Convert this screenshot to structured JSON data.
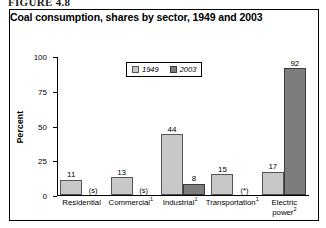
{
  "figure": {
    "caption": "FIGURE 4.8"
  },
  "chart_data": {
    "type": "bar",
    "title": "Coal consumption, shares by sector, 1949 and 2003",
    "xlabel": "",
    "ylabel": "Percent",
    "ylim": [
      0,
      100
    ],
    "yticks": [
      0,
      25,
      50,
      75,
      100
    ],
    "ytick_labels": [
      "0",
      "25",
      "50",
      "75",
      "100"
    ],
    "grid": false,
    "legend_position": "top-center",
    "categories": [
      "Residential",
      "Commercial",
      "Industrial",
      "Transportation",
      "Electric power"
    ],
    "category_footnotes": [
      "",
      "1",
      "1",
      "1",
      "2"
    ],
    "series": [
      {
        "name": "1949",
        "color": "#c8c8c8",
        "values": [
          11,
          13,
          44,
          15,
          17
        ],
        "labels": [
          "11",
          "13",
          "44",
          "15",
          "17"
        ]
      },
      {
        "name": "2003",
        "color": "#7d7d7d",
        "values": [
          0,
          0,
          8,
          0,
          92
        ],
        "labels": [
          "(s)",
          "(s)",
          "8",
          "(*)",
          "92"
        ]
      }
    ]
  },
  "bars": [
    {
      "category": "Residential",
      "footnote": "",
      "s1949": {
        "value": 11,
        "label": "11",
        "note": ""
      },
      "s2003": {
        "value": 0,
        "label": "",
        "note": "(s)"
      }
    },
    {
      "category": "Commercial",
      "footnote": "1",
      "s1949": {
        "value": 13,
        "label": "13",
        "note": ""
      },
      "s2003": {
        "value": 0,
        "label": "",
        "note": "(s)"
      }
    },
    {
      "category": "Industrial",
      "footnote": "1",
      "s1949": {
        "value": 44,
        "label": "44",
        "note": ""
      },
      "s2003": {
        "value": 8,
        "label": "8",
        "note": ""
      }
    },
    {
      "category": "Transportation",
      "footnote": "1",
      "s1949": {
        "value": 15,
        "label": "15",
        "note": ""
      },
      "s2003": {
        "value": 0,
        "label": "",
        "note": "(*)"
      }
    },
    {
      "category": "Electric power",
      "footnote": "2",
      "s1949": {
        "value": 17,
        "label": "17",
        "note": ""
      },
      "s2003": {
        "value": 92,
        "label": "92",
        "note": ""
      }
    }
  ],
  "legend": {
    "items": [
      {
        "label": "1949",
        "color": "#c8c8c8"
      },
      {
        "label": "2003",
        "color": "#7d7d7d"
      }
    ]
  },
  "colors": {
    "series_1949": "#c8c8c8",
    "series_2003": "#7d7d7d",
    "axis": "#000000",
    "border": "#000000",
    "background": "#ffffff"
  }
}
